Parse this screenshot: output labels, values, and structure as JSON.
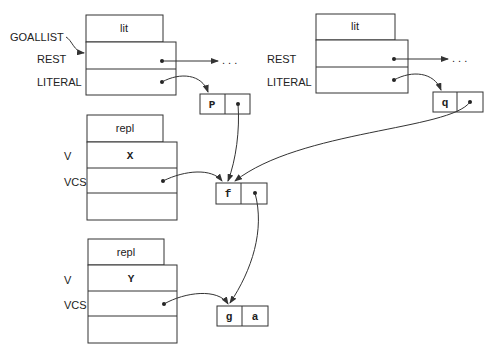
{
  "diagram": {
    "records": {
      "lit1": {
        "type": "lit",
        "fields": [
          "REST",
          "LITERAL"
        ],
        "extra_label": "GOALLIST"
      },
      "lit2": {
        "type": "lit",
        "fields": [
          "REST",
          "LITERAL"
        ]
      },
      "repl1": {
        "type": "repl",
        "fields": [
          "V",
          "VCS"
        ],
        "v_value": "X"
      },
      "repl2": {
        "type": "repl",
        "fields": [
          "V",
          "VCS"
        ],
        "v_value": "Y"
      }
    },
    "cells": {
      "p": {
        "left": "P"
      },
      "q": {
        "left": "q"
      },
      "f": {
        "left": "f"
      },
      "ga": {
        "left": "g",
        "right": "a"
      }
    },
    "ellipsis": ". . .",
    "edges": [
      {
        "from": "lit1.REST",
        "to": "ellipsis"
      },
      {
        "from": "lit1.LITERAL",
        "to": "p"
      },
      {
        "from": "lit2.REST",
        "to": "ellipsis"
      },
      {
        "from": "lit2.LITERAL",
        "to": "q"
      },
      {
        "from": "p.right",
        "to": "f"
      },
      {
        "from": "q.right",
        "to": "f"
      },
      {
        "from": "repl1.VCS",
        "to": "f"
      },
      {
        "from": "f.right",
        "to": "ga"
      },
      {
        "from": "repl2.VCS",
        "to": "ga"
      }
    ]
  }
}
